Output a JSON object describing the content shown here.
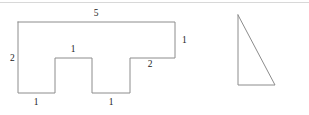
{
  "figure": {
    "stroke_color": "#8c8c8c",
    "label_color": "#222222",
    "background_color": "#ffffff",
    "rule_color": "#d8d8d8",
    "stroke_width": 1,
    "top_rule": {
      "name": "top-divider-rule",
      "y": 2
    },
    "polygon": {
      "name": "rectilinear-polygon",
      "points": "18,22 175,22 175,58 130,58 130,93 92,93 92,58 55,58 55,93 18,93",
      "labels": [
        {
          "id": "top-5",
          "text": "5",
          "x": 96,
          "y": 16,
          "anchor": "middle",
          "edge": "top"
        },
        {
          "id": "right-1",
          "text": "1",
          "x": 182,
          "y": 43,
          "anchor": "start",
          "edge": "right-upper"
        },
        {
          "id": "left-2",
          "text": "2",
          "x": 10,
          "y": 61,
          "anchor": "start",
          "edge": "left"
        },
        {
          "id": "bump-1",
          "text": "1",
          "x": 73,
          "y": 52,
          "anchor": "middle",
          "edge": "first-bump-top"
        },
        {
          "id": "step-2",
          "text": "2",
          "x": 150,
          "y": 67,
          "anchor": "middle",
          "edge": "right-step"
        },
        {
          "id": "bottom-left-1",
          "text": "1",
          "x": 36,
          "y": 105,
          "anchor": "middle",
          "edge": "bottom-left"
        },
        {
          "id": "bottom-mid-1",
          "text": "1",
          "x": 111,
          "y": 105,
          "anchor": "middle",
          "edge": "bottom-middle"
        }
      ]
    },
    "triangle": {
      "name": "right-triangle",
      "points": "238,15 238,85 275,85",
      "labels": []
    }
  }
}
